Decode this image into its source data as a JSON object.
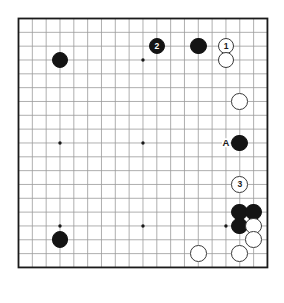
{
  "diagram": {
    "kind": "go-board-diagram",
    "board_size": 19,
    "colors": {
      "background": "#ffffff",
      "board_fill": "#ffffff",
      "grid_line": "#9a9a9a",
      "border_line": "#1a1a1a",
      "black_stone": "#141414",
      "white_stone": "#ffffff",
      "white_stone_edge": "#3a3a3a",
      "label_text": "#1a1a1a"
    },
    "geometry": {
      "origin_x": 18.5,
      "origin_y": 18.5,
      "spacing": 13.83,
      "stone_diameter": 16.6,
      "border_width": 1.8,
      "grid_width": 0.8
    },
    "star_points": [
      {
        "col": 4,
        "row": 4
      },
      {
        "col": 10,
        "row": 4
      },
      {
        "col": 16,
        "row": 4
      },
      {
        "col": 4,
        "row": 10
      },
      {
        "col": 10,
        "row": 10
      },
      {
        "col": 16,
        "row": 10
      },
      {
        "col": 4,
        "row": 16
      },
      {
        "col": 10,
        "row": 16
      },
      {
        "col": 16,
        "row": 16
      }
    ],
    "stones": [
      {
        "id": "b-d16",
        "color": "black",
        "col": 4,
        "row": 4,
        "label": ""
      },
      {
        "id": "b-k17",
        "color": "black",
        "col": 11,
        "row": 3,
        "label": "2"
      },
      {
        "id": "b-n17",
        "color": "black",
        "col": 14,
        "row": 3,
        "label": ""
      },
      {
        "id": "w-p17",
        "color": "white",
        "col": 16,
        "row": 3,
        "label": "1"
      },
      {
        "id": "w-p16",
        "color": "white",
        "col": 16,
        "row": 4,
        "label": ""
      },
      {
        "id": "w-q13",
        "color": "white",
        "col": 17,
        "row": 7,
        "label": ""
      },
      {
        "id": "b-q10",
        "color": "black",
        "col": 17,
        "row": 10,
        "label": ""
      },
      {
        "id": "w-q7",
        "color": "white",
        "col": 17,
        "row": 13,
        "label": "3"
      },
      {
        "id": "b-q5",
        "color": "black",
        "col": 17,
        "row": 15,
        "label": ""
      },
      {
        "id": "b-r5",
        "color": "black",
        "col": 18,
        "row": 15,
        "label": ""
      },
      {
        "id": "b-q4",
        "color": "black",
        "col": 17,
        "row": 16,
        "label": ""
      },
      {
        "id": "w-r4",
        "color": "white",
        "col": 18,
        "row": 16,
        "label": ""
      },
      {
        "id": "w-r3",
        "color": "white",
        "col": 18,
        "row": 17,
        "label": ""
      },
      {
        "id": "w-q2",
        "color": "white",
        "col": 17,
        "row": 18,
        "label": ""
      },
      {
        "id": "w-n2",
        "color": "white",
        "col": 14,
        "row": 18,
        "label": ""
      },
      {
        "id": "b-d4",
        "color": "black",
        "col": 4,
        "row": 17,
        "label": ""
      }
    ],
    "point_labels": [
      {
        "id": "label-a",
        "text": "A",
        "col": 16,
        "row": 10
      }
    ],
    "move_numbers": [
      "1",
      "2",
      "3"
    ],
    "marked_point": "A"
  }
}
